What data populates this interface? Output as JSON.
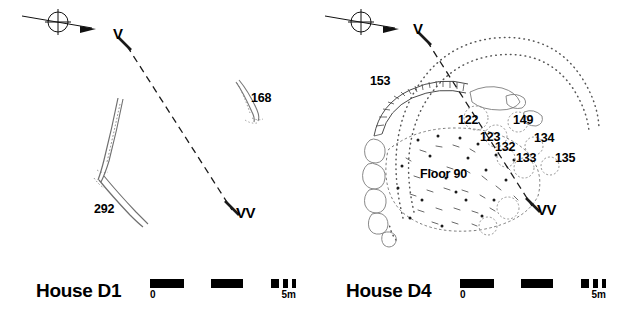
{
  "figure": {
    "type": "archaeological-site-plan",
    "panel_count": 2
  },
  "panels": [
    {
      "id": "d1",
      "title": "House D1",
      "direction_symbol": "north-arrow-crosshair-icon",
      "section_line": {
        "start_label": "V",
        "end_label": "VV",
        "style": "dashed"
      },
      "features": [
        {
          "id": "168",
          "label": "168",
          "kind": "curved-stone-alignment"
        },
        {
          "id": "292",
          "label": "292",
          "kind": "forked-wall-line"
        }
      ],
      "scale": {
        "zero_label": "0",
        "max_label": "5m",
        "units": "m",
        "length_m": 5
      }
    },
    {
      "id": "d4",
      "title": "House D4",
      "direction_symbol": "north-arrow-crosshair-icon",
      "section_line": {
        "start_label": "V",
        "end_label": "VV",
        "style": "dashed"
      },
      "features": [
        {
          "id": "153",
          "label": "153",
          "kind": "outer-dotted-contour"
        },
        {
          "id": "122",
          "label": "122",
          "kind": "pit"
        },
        {
          "id": "123",
          "label": "123",
          "kind": "pit"
        },
        {
          "id": "132",
          "label": "132",
          "kind": "pit"
        },
        {
          "id": "133",
          "label": "133",
          "kind": "pit"
        },
        {
          "id": "134",
          "label": "134",
          "kind": "pit"
        },
        {
          "id": "135",
          "label": "135",
          "kind": "pit"
        },
        {
          "id": "149",
          "label": "149",
          "kind": "pit"
        },
        {
          "id": "90",
          "label": "Floor 90",
          "kind": "floor-surface"
        }
      ],
      "scale": {
        "zero_label": "0",
        "max_label": "5m",
        "units": "m",
        "length_m": 5
      }
    }
  ],
  "colors": {
    "ink": "#000000",
    "stone_outline": "#6a6a6a",
    "stipple": "#555555",
    "background": "#ffffff"
  }
}
